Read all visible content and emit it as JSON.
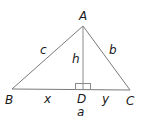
{
  "diagram": {
    "type": "triangle-with-altitude",
    "vertices": {
      "A": {
        "label": "A",
        "x": 83,
        "y": 26
      },
      "B": {
        "label": "B",
        "x": 12,
        "y": 89
      },
      "C": {
        "label": "C",
        "x": 130,
        "y": 90
      },
      "D": {
        "label": "D",
        "x": 83,
        "y": 89
      }
    },
    "side_labels": {
      "c": "c",
      "b": "b",
      "h": "h",
      "x": "x",
      "y": "y",
      "a": "a"
    },
    "right_angle_marker": {
      "at": "D"
    },
    "colors": {
      "lines": "#7a7a7a",
      "text": "#1a1a1a",
      "background": "#ffffff"
    }
  }
}
